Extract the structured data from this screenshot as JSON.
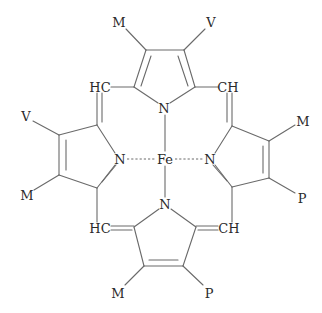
{
  "diagram": {
    "center_atom": "Fe",
    "nitrogen_label": "N",
    "substituents": {
      "top_left": "M",
      "top_right": "V",
      "left_top": "V",
      "left_bottom": "M",
      "right_top": "M",
      "right_bottom": "P",
      "bottom_left": "M",
      "bottom_right": "P"
    },
    "methine_bridges": {
      "top_left": "HC",
      "top_right": "CH",
      "bottom_left": "HC",
      "bottom_right": "CH"
    },
    "colors": {
      "line": "#6a6a6a",
      "text": "#2a2a2a",
      "background": "#ffffff"
    }
  }
}
